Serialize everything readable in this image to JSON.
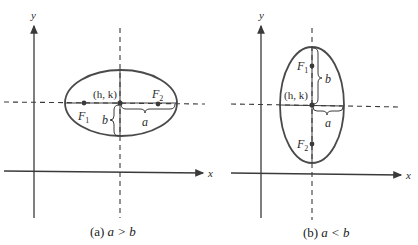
{
  "diagram": {
    "panels": [
      {
        "id": "a",
        "caption_prefix": "(a)",
        "caption_relation": "a > b",
        "axis_labels": {
          "x": "x",
          "y": "y"
        },
        "center_label": "(h, k)",
        "focus1_label": "F",
        "focus1_sub": "1",
        "focus2_label": "F",
        "focus2_sub": "2",
        "semi_major_label": "a",
        "semi_minor_label": "b",
        "orientation": "horizontal"
      },
      {
        "id": "b",
        "caption_prefix": "(b)",
        "caption_relation": "a < b",
        "axis_labels": {
          "x": "x",
          "y": "y"
        },
        "center_label": "(h, k)",
        "focus1_label": "F",
        "focus1_sub": "1",
        "focus2_label": "F",
        "focus2_sub": "2",
        "semi_major_label": "b",
        "semi_minor_label": "a",
        "orientation": "vertical"
      }
    ],
    "colors": {
      "stroke": "#3a3a3a",
      "ellipse": "#4a4a4a",
      "background": "#ffffff"
    }
  }
}
